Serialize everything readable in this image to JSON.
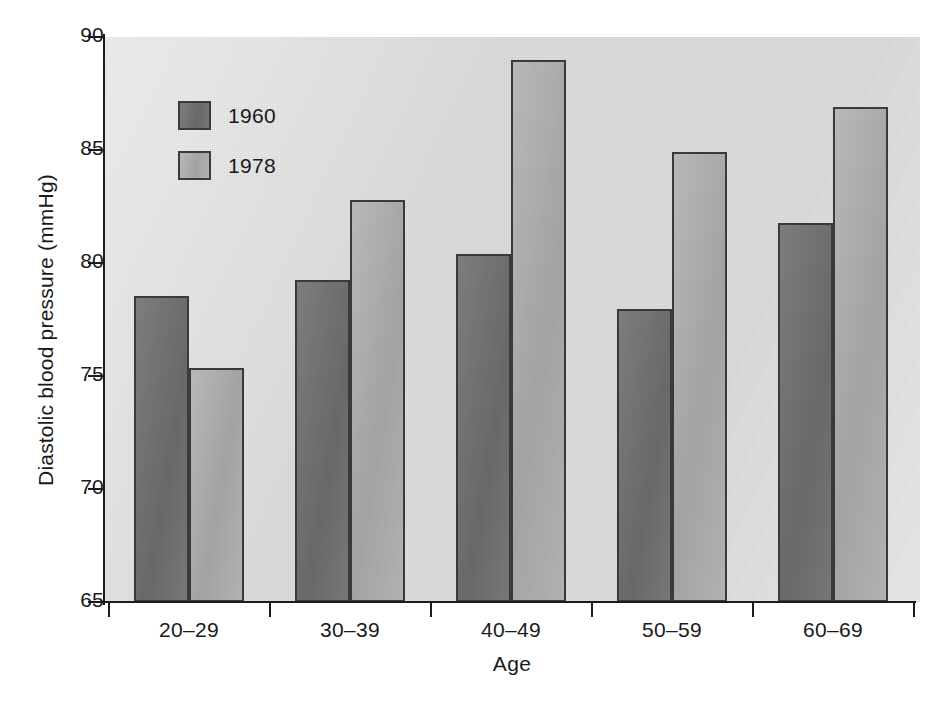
{
  "chart_data": {
    "type": "bar",
    "title": "",
    "xlabel": "Age",
    "ylabel": "Diastolic blood pressure (mmHg)",
    "categories": [
      "20–29",
      "30–39",
      "40–49",
      "50–59",
      "60–69"
    ],
    "series": [
      {
        "name": "1960",
        "color": "#6e6e6e",
        "values": [
          78.55,
          79.25,
          80.4,
          77.95,
          81.75
        ]
      },
      {
        "name": "1978",
        "color": "#a8a8a8",
        "values": [
          75.35,
          82.8,
          89.0,
          84.9,
          86.9
        ]
      }
    ],
    "ylim": [
      65,
      90
    ],
    "yticks": [
      65,
      70,
      75,
      80,
      85,
      90
    ],
    "ytick_labels": [
      "65",
      "70",
      "75",
      "80",
      "85",
      "90"
    ],
    "grid": false,
    "legend_position": "upper left inside plot",
    "plot_background": "#dcdcdc",
    "axis_color": "#1c1c1c",
    "bar_border_color": "#3a3a3a"
  },
  "axes": {
    "y_title": "Diastolic blood pressure (mmHg)",
    "x_title": "Age"
  },
  "legend": {
    "entries": [
      {
        "label": "1960"
      },
      {
        "label": "1978"
      }
    ]
  }
}
